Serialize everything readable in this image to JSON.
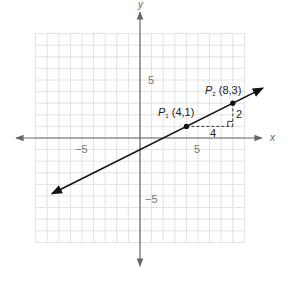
{
  "chart_data": {
    "type": "line",
    "title": "",
    "xlabel": "x",
    "ylabel": "y",
    "xlim": [
      -9,
      9
    ],
    "ylim": [
      -9,
      9
    ],
    "grid": true,
    "x_ticks_labeled": [
      -5,
      5
    ],
    "y_ticks_labeled": [
      5,
      -5
    ],
    "tick_labels": {
      "x_neg": "−5",
      "x_pos": "5",
      "y_pos": "5",
      "y_neg": "−5"
    },
    "series": [
      {
        "name": "line",
        "slope": 0.5,
        "intercept": -1,
        "equation": "y = x/2 - 1",
        "x": [
          -7.6,
          10.6
        ],
        "y": [
          -4.8,
          4.3
        ]
      }
    ],
    "points": [
      {
        "name": "P1",
        "label_main": "P",
        "label_sub": "1",
        "coords": "(4,1)",
        "x": 4,
        "y": 1
      },
      {
        "name": "P2",
        "label_main": "P",
        "label_sub": "2",
        "coords": "(8,3)",
        "x": 8,
        "y": 3
      }
    ],
    "annotations": [
      {
        "type": "run",
        "text": "4",
        "from": [
          4,
          1
        ],
        "to": [
          8,
          1
        ],
        "style": "dashed"
      },
      {
        "type": "rise",
        "text": "2",
        "from": [
          8,
          1
        ],
        "to": [
          8,
          3
        ],
        "style": "dashed"
      },
      {
        "type": "right-angle-marker",
        "at": [
          8,
          1
        ]
      }
    ]
  },
  "colors": {
    "grid": "#e2e2e2",
    "axis": "#666666",
    "line": "#111111",
    "text": "#555555"
  }
}
